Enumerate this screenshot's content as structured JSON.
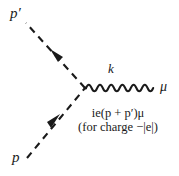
{
  "figure": {
    "type": "feynman-diagram",
    "background_color": "#ffffff",
    "ink_color": "#1a1a1a"
  },
  "labels": {
    "incoming_momentum": "p",
    "outgoing_momentum": "p′",
    "photon_momentum": "k",
    "photon_index": "μ"
  },
  "vertex_factor": {
    "line1": "ie(p + p′)μ",
    "line2": "(for charge −|e|)"
  },
  "lines": [
    {
      "name": "outgoing-scalar-line",
      "style": "dashed",
      "from": [
        85,
        88
      ],
      "to": [
        25,
        22
      ],
      "arrow_at": [
        57,
        55
      ],
      "arrow_direction": "up-left"
    },
    {
      "name": "incoming-scalar-line",
      "style": "dashed",
      "from": [
        27,
        158
      ],
      "to": [
        85,
        88
      ],
      "arrow_at": [
        53,
        123
      ],
      "arrow_direction": "up-right"
    },
    {
      "name": "photon-line",
      "style": "wavy",
      "from": [
        86,
        88
      ],
      "to": [
        156,
        88
      ],
      "wavelength": 11,
      "amplitude": 5
    }
  ]
}
